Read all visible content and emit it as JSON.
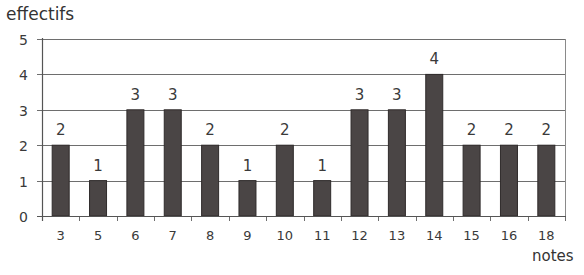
{
  "chart_data": {
    "type": "bar",
    "title": "",
    "xlabel": "notes",
    "ylabel": "effectifs",
    "categories": [
      "3",
      "5",
      "6",
      "7",
      "8",
      "9",
      "10",
      "11",
      "12",
      "13",
      "14",
      "15",
      "16",
      "18"
    ],
    "values": [
      2,
      1,
      3,
      3,
      2,
      1,
      2,
      1,
      3,
      3,
      4,
      2,
      2,
      2
    ],
    "data_labels": [
      "2",
      "1",
      "3",
      "3",
      "2",
      "1",
      "2",
      "1",
      "3",
      "3",
      "4",
      "2",
      "2",
      "2"
    ],
    "ylim": [
      0,
      5
    ],
    "yticks": [
      "0",
      "1",
      "2",
      "3",
      "4",
      "5"
    ],
    "grid": true,
    "legend": null,
    "bar_color": "#4a4545"
  }
}
